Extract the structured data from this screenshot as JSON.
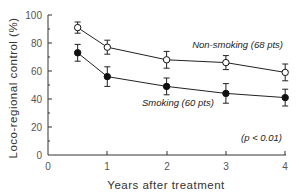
{
  "chart_data": {
    "type": "line",
    "title": "",
    "xlabel": "Years after treatment",
    "ylabel": "Loco-regional control (%)",
    "xlim": [
      0,
      4
    ],
    "ylim": [
      0,
      100
    ],
    "x_ticks": [
      "0",
      "1",
      "2",
      "3",
      "4"
    ],
    "y_ticks": [
      "0",
      "20",
      "40",
      "60",
      "80",
      "100"
    ],
    "grid": false,
    "x": [
      0.5,
      1,
      2,
      3,
      4
    ],
    "series": [
      {
        "name": "Non-smoking (68 pts)",
        "marker": "open-circle",
        "values": [
          91,
          77,
          68,
          66,
          59
        ],
        "error": [
          4,
          5,
          6,
          5,
          6
        ]
      },
      {
        "name": "Smoking (60 pts)",
        "marker": "filled-circle",
        "values": [
          73,
          56,
          49,
          44,
          41
        ],
        "error": [
          6,
          7,
          6,
          7,
          6
        ]
      }
    ],
    "annotations": [
      "(p < 0.01)"
    ],
    "legend_position": "inline labels next to lines"
  },
  "labels": {
    "non_smoking": "Non-smoking (68 pts)",
    "smoking": "Smoking (60 pts)",
    "p_value": "(p < 0.01)",
    "xlabel": "Years after treatment",
    "ylabel": "Loco-regional control (%)"
  },
  "ticks": {
    "x": [
      "0",
      "1",
      "2",
      "3",
      "4"
    ],
    "y": [
      "0",
      "20",
      "40",
      "60",
      "80",
      "100"
    ]
  }
}
